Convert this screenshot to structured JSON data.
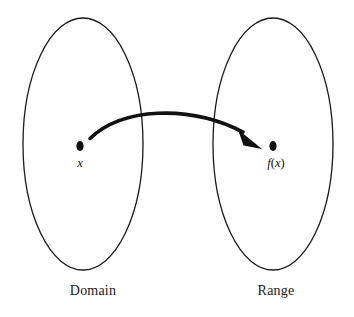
{
  "diagram": {
    "type": "function-mapping-venn",
    "title": "",
    "background_color": "#ffffff",
    "stroke_color": "#1a1a1a",
    "sets": [
      {
        "id": "domain",
        "label": "Domain",
        "shape": "ellipse",
        "center": [
          83,
          144
        ],
        "radius": [
          60,
          126
        ],
        "label_position": [
          93,
          290
        ]
      },
      {
        "id": "range",
        "label": "Range",
        "shape": "ellipse",
        "center": [
          273,
          144
        ],
        "radius": [
          60,
          126
        ],
        "label_position": [
          276,
          290
        ]
      }
    ],
    "points": [
      {
        "id": "x-point",
        "label_text": "x",
        "label_italic": "x",
        "position": [
          80,
          146
        ],
        "label_position": [
          80,
          164
        ],
        "set": "domain"
      },
      {
        "id": "fx-point",
        "label_text": "f(x)",
        "label_parts": {
          "f": "f",
          "open": "(",
          "var": "x",
          "close": ")"
        },
        "position": [
          273,
          146
        ],
        "label_position": [
          276,
          164
        ],
        "set": "range"
      }
    ],
    "arrow": {
      "id": "mapping-arrow",
      "from": [
        90,
        138
      ],
      "to": [
        262,
        146
      ],
      "curve": "arc-upward",
      "style": "solid",
      "arrowhead": "solid-triangle",
      "color": "#111111"
    }
  }
}
